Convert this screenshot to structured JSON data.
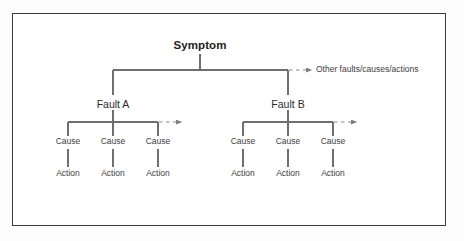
{
  "diagram": {
    "type": "fault-tree",
    "root": {
      "label": "Symptom",
      "x": 200,
      "y": 46
    },
    "branches": [
      {
        "label": "Fault A",
        "x": 113,
        "y": 104,
        "continuation_arrow": true,
        "children": [
          {
            "cause": "Cause",
            "action": "Action",
            "x": 68
          },
          {
            "cause": "Cause",
            "action": "Action",
            "x": 113
          },
          {
            "cause": "Cause",
            "action": "Action",
            "x": 158
          }
        ]
      },
      {
        "label": "Fault B",
        "x": 288,
        "y": 104,
        "continuation_arrow": true,
        "children": [
          {
            "cause": "Cause",
            "action": "Action",
            "x": 243
          },
          {
            "cause": "Cause",
            "action": "Action",
            "x": 288
          },
          {
            "cause": "Cause",
            "action": "Action",
            "x": 333
          }
        ]
      }
    ],
    "annotation": {
      "text": "Other faults/causes/actions",
      "x": 318,
      "y": 68
    },
    "colors": {
      "frame_border": "#3a3a3a",
      "connector_line": "#6e6e6e",
      "dashed_line": "#8a8a8a",
      "text": "#1d1d1d",
      "background": "#ffffff"
    },
    "rows": {
      "cause_y": 143,
      "action_y": 175
    }
  }
}
